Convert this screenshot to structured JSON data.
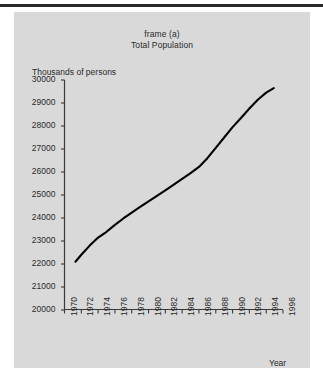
{
  "figure": {
    "title_line1": "frame (a)",
    "title_line2": "Total Population",
    "background_color": "#d9d9d9",
    "page_color": "#ffffff",
    "line_color": "#000000",
    "axis_color": "#3a3a3a",
    "bottom_caption": "The  remainder  of"
  },
  "chart_data": {
    "type": "line",
    "title": "frame (a) Total Population",
    "subtitle": "Total Population",
    "xlabel": "Year",
    "ylabel": "Thousands of persons",
    "xlim": [
      1970,
      1996
    ],
    "ylim": [
      20000,
      30000
    ],
    "grid": false,
    "legend": null,
    "xticks": [
      1970,
      1972,
      1974,
      1976,
      1978,
      1980,
      1982,
      1984,
      1986,
      1988,
      1990,
      1992,
      1994,
      1996
    ],
    "xtick_labels": [
      "1970",
      "1972",
      "1974",
      "1976",
      "1978",
      "1980",
      "1982",
      "1984",
      "1986",
      "1988",
      "1990",
      "1992",
      "1994",
      "1996"
    ],
    "yticks": [
      20000,
      21000,
      22000,
      23000,
      24000,
      25000,
      26000,
      27000,
      28000,
      29000,
      30000
    ],
    "ytick_labels": [
      "20000",
      "21000",
      "22000",
      "23000",
      "24000",
      "25000",
      "26000",
      "27000",
      "28000",
      "29000",
      "30000"
    ],
    "series": [
      {
        "name": "Total Population",
        "x": [
          1971.3,
          1972,
          1973,
          1974,
          1975,
          1976,
          1977,
          1978,
          1979,
          1980,
          1981,
          1982,
          1983,
          1984,
          1985,
          1986,
          1987,
          1988,
          1989,
          1990,
          1991,
          1992,
          1993,
          1994,
          1994.9
        ],
        "values": [
          22100,
          22400,
          22800,
          23150,
          23400,
          23700,
          23980,
          24230,
          24480,
          24720,
          24960,
          25200,
          25450,
          25700,
          25950,
          26220,
          26600,
          27050,
          27500,
          27950,
          28350,
          28760,
          29140,
          29450,
          29650
        ]
      }
    ]
  },
  "axis_labels": {
    "y_caption": "Thousands of persons",
    "x_caption": "Year"
  }
}
